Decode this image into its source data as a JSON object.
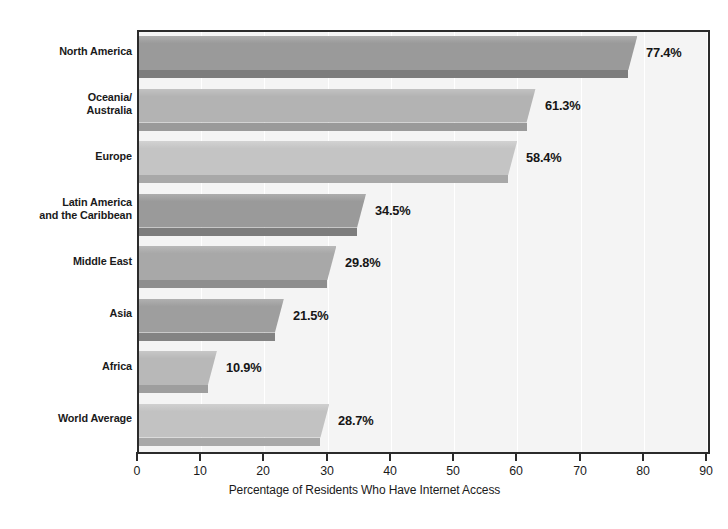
{
  "chart_data": {
    "type": "bar",
    "orientation": "horizontal",
    "title": "",
    "xlabel": "Percentage of Residents Who Have Internet Access",
    "ylabel": "",
    "xlim": [
      0,
      90
    ],
    "xticks": [
      0,
      10,
      20,
      30,
      40,
      50,
      60,
      70,
      80,
      90
    ],
    "xtick_labels": [
      "0",
      "10",
      "20",
      "30",
      "40",
      "50",
      "60",
      "70",
      "80",
      "90"
    ],
    "grid": true,
    "grid_axis": "x",
    "legend": "none",
    "value_label_suffix": "%",
    "categories": [
      "North America",
      "Oceania/\nAustralia",
      "Europe",
      "Latin America\nand the Caribbean",
      "Middle East",
      "Asia",
      "Africa",
      "World Average"
    ],
    "values": [
      77.4,
      61.3,
      58.4,
      34.5,
      29.8,
      21.5,
      10.9,
      28.7
    ],
    "value_labels": [
      "77.4%",
      "61.3%",
      "58.4%",
      "34.5%",
      "29.8%",
      "21.5%",
      "10.9%",
      "28.7%"
    ],
    "bar_colors": [
      "#9a9a9a",
      "#b3b3b3",
      "#c4c4c4",
      "#9a9a9a",
      "#a8a8a8",
      "#9e9e9e",
      "#b8b8b8",
      "#c2c2c2"
    ],
    "bar_shadow_colors": [
      "#7d7d7d",
      "#9a9a9a",
      "#a8a8a8",
      "#7d7d7d",
      "#8e8e8e",
      "#838383",
      "#9e9e9e",
      "#a8a8a8"
    ],
    "bar_highlight_colors": [
      "#adadad",
      "#c2c2c2",
      "#d2d2d2",
      "#adadad",
      "#b8b8b8",
      "#b0b0b0",
      "#c7c7c7",
      "#d0d0d0"
    ]
  },
  "style": {
    "plot_background": "#f4f4f4",
    "axis_color": "#2b2b2b",
    "gridline_color": "#ffffff",
    "text_color": "#1a1a1a",
    "page_background": "#ffffff"
  }
}
